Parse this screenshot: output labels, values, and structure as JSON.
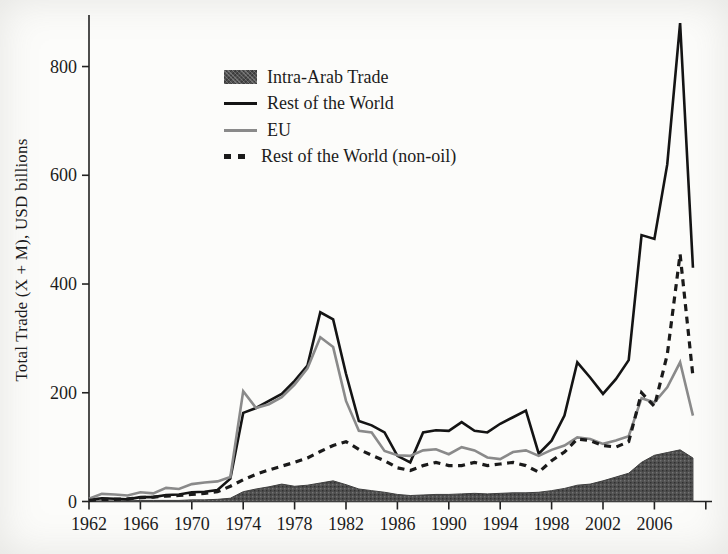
{
  "chart_data": {
    "type": "line",
    "title": "",
    "xlabel": "",
    "ylabel": "Total Trade (X + M), USD billions",
    "ylim": [
      0,
      900
    ],
    "xlim": [
      1962,
      2010
    ],
    "y_ticks": [
      0,
      200,
      400,
      600,
      800
    ],
    "x_ticks": [
      1962,
      1966,
      1970,
      1974,
      1978,
      1982,
      1986,
      1990,
      1994,
      1998,
      2002,
      2006,
      2010
    ],
    "x_tick_labels": [
      "1962",
      "1966",
      "1970",
      "1974",
      "1978",
      "1982",
      "1986",
      "1990",
      "1994",
      "1998",
      "2002",
      "2006",
      ""
    ],
    "grid": false,
    "legend_position": "upper-left-inside",
    "years": [
      1962,
      1963,
      1964,
      1965,
      1966,
      1967,
      1968,
      1969,
      1970,
      1971,
      1972,
      1973,
      1974,
      1975,
      1976,
      1977,
      1978,
      1979,
      1980,
      1981,
      1982,
      1983,
      1984,
      1985,
      1986,
      1987,
      1988,
      1989,
      1990,
      1991,
      1992,
      1993,
      1994,
      1995,
      1996,
      1997,
      1998,
      1999,
      2000,
      2001,
      2002,
      2003,
      2004,
      2005,
      2006,
      2007,
      2008,
      2009
    ],
    "series": [
      {
        "name": "Intra-Arab Trade",
        "type": "area",
        "color": "#4f4f4f",
        "values": [
          1,
          1,
          1,
          1,
          2,
          2,
          2,
          2,
          3,
          3,
          4,
          6,
          18,
          23,
          27,
          32,
          28,
          30,
          34,
          38,
          31,
          23,
          20,
          17,
          13,
          11,
          12,
          13,
          13,
          14,
          15,
          14,
          15,
          16,
          16,
          17,
          20,
          24,
          30,
          32,
          38,
          45,
          52,
          72,
          85,
          90,
          95,
          80
        ]
      },
      {
        "name": "Rest of the World",
        "type": "line",
        "color": "#141414",
        "values": [
          3,
          6,
          5,
          4,
          8,
          8,
          12,
          13,
          17,
          18,
          21,
          42,
          163,
          172,
          185,
          198,
          222,
          250,
          348,
          335,
          235,
          148,
          140,
          127,
          84,
          72,
          127,
          131,
          130,
          146,
          130,
          127,
          143,
          155,
          167,
          88,
          112,
          158,
          256,
          228,
          198,
          225,
          260,
          490,
          483,
          620,
          880,
          430
        ]
      },
      {
        "name": "EU",
        "type": "line",
        "color": "#8a8a8a",
        "values": [
          5,
          14,
          13,
          11,
          17,
          15,
          25,
          23,
          32,
          35,
          37,
          45,
          203,
          172,
          179,
          192,
          215,
          245,
          302,
          284,
          185,
          130,
          127,
          93,
          85,
          84,
          94,
          96,
          87,
          100,
          94,
          81,
          78,
          91,
          94,
          84,
          95,
          103,
          118,
          115,
          106,
          112,
          120,
          190,
          182,
          210,
          256,
          158
        ]
      },
      {
        "name": "Rest of the World (non-oil)",
        "type": "dashed-line",
        "color": "#1a1a1a",
        "values": [
          2,
          4,
          4,
          5,
          7,
          8,
          10,
          11,
          13,
          15,
          18,
          28,
          40,
          50,
          58,
          65,
          72,
          80,
          92,
          103,
          110,
          96,
          85,
          75,
          62,
          57,
          66,
          72,
          66,
          66,
          72,
          66,
          69,
          72,
          66,
          54,
          75,
          91,
          115,
          112,
          103,
          100,
          110,
          200,
          175,
          270,
          455,
          230
        ]
      }
    ]
  },
  "legend": {
    "items": [
      {
        "label": "Intra-Arab Trade",
        "swatch": "area-fill"
      },
      {
        "label": "Rest of the World",
        "swatch": "solid-black-line"
      },
      {
        "label": "EU",
        "swatch": "solid-gray-line"
      },
      {
        "label": "Rest of the World (non-oil)",
        "swatch": "dashed-black-line"
      }
    ]
  }
}
